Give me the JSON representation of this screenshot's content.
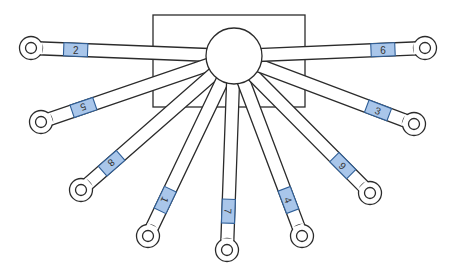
{
  "diagram": {
    "colors": {
      "line": "#2b2b2b",
      "background": "#ffffff",
      "tab_fill": "#a9c6ea",
      "tab_stroke": "#2f5f98"
    },
    "hub": {
      "cx": 234,
      "cy": 56,
      "r": 28
    },
    "plate": {
      "x": 153,
      "y": 15,
      "width": 152,
      "height": 92
    },
    "arms": [
      {
        "label": "2",
        "end": [
          31,
          48
        ],
        "tab_t": 0.78
      },
      {
        "label": "5",
        "end": [
          41,
          122
        ],
        "tab_t": 0.78
      },
      {
        "label": "8",
        "end": [
          81,
          190
        ],
        "tab_t": 0.8
      },
      {
        "label": "1",
        "end": [
          148,
          236
        ],
        "tab_t": 0.8
      },
      {
        "label": "7",
        "end": [
          227,
          250
        ],
        "tab_t": 0.8
      },
      {
        "label": "4",
        "end": [
          302,
          236
        ],
        "tab_t": 0.8
      },
      {
        "label": "9",
        "end": [
          370,
          193
        ],
        "tab_t": 0.8
      },
      {
        "label": "3",
        "end": [
          414,
          124
        ],
        "tab_t": 0.8
      },
      {
        "label": "6",
        "end": [
          425,
          48
        ],
        "tab_t": 0.78
      }
    ]
  }
}
